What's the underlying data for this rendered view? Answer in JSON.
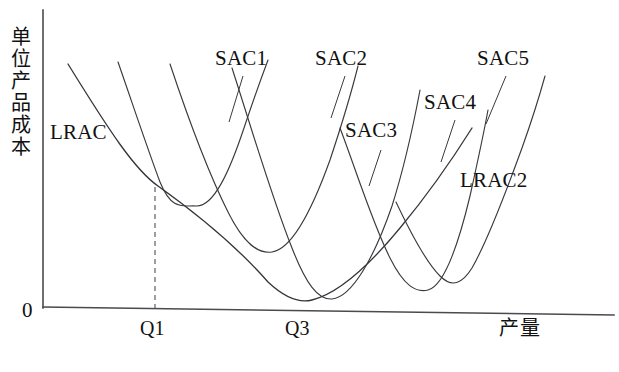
{
  "chart_data": {
    "type": "line",
    "title": "",
    "xlabel": "产量",
    "ylabel": "单位产品成本",
    "grid": false,
    "legend_position": "inline-annotations",
    "xlim": [
      0,
      1
    ],
    "ylim": [
      0,
      1
    ],
    "axis": {
      "origin_label": "0",
      "x_ticks": [
        "Q1",
        "Q3"
      ],
      "x_tick_positions": [
        155,
        300
      ],
      "y_ticks": []
    },
    "annotations": [
      {
        "text": "LRAC",
        "x": 50,
        "y": 122
      },
      {
        "text": "SAC1",
        "x": 215,
        "y": 48
      },
      {
        "text": "SAC2",
        "x": 315,
        "y": 48
      },
      {
        "text": "SAC3",
        "x": 345,
        "y": 120
      },
      {
        "text": "SAC4",
        "x": 424,
        "y": 92
      },
      {
        "text": "SAC5",
        "x": 477,
        "y": 48
      },
      {
        "text": "LRAC2",
        "x": 460,
        "y": 170
      }
    ],
    "series": [
      {
        "name": "LRAC",
        "role": "long-run-envelope",
        "description": "Long-run average cost envelope curve, U-shaped, minimum near Q3",
        "path": "M 68,64 C 110,132 135,170 158,186 C 200,216 240,250 268,282 C 285,298 300,303 312,300 C 340,293 372,262 400,228 C 430,192 455,155 472,128"
      },
      {
        "name": "SAC1",
        "role": "short-run-average-cost",
        "description": "Short-run average cost curve 1, tangent to LRAC at Q1",
        "path": "M 118,62 C 134,108 148,150 160,182 C 172,212 184,205 196,206 C 214,207 230,170 244,128 C 254,98 262,76 268,60"
      },
      {
        "name": "SAC2",
        "role": "short-run-average-cost",
        "description": "Short-run average cost curve 2",
        "path": "M 170,64 C 188,118 208,172 228,212 C 244,244 258,254 272,252 C 292,249 312,210 330,160 C 342,124 352,90 358,66"
      },
      {
        "name": "SAC3",
        "role": "short-run-average-cost",
        "description": "Short-run average cost curve 3, tangent near the LRAC minimum at Q3",
        "path": "M 232,68 C 252,130 272,198 292,248 C 306,284 318,300 332,299 C 352,297 374,258 392,206 C 404,168 414,122 420,90"
      },
      {
        "name": "SAC4",
        "role": "short-run-average-cost",
        "description": "Short-run average cost curve 4",
        "path": "M 340,128 C 356,170 372,222 390,258 C 404,286 416,293 428,290 C 444,286 458,246 470,196 C 478,160 484,132 488,110"
      },
      {
        "name": "SAC5",
        "role": "short-run-average-cost",
        "description": "Short-run average cost curve 5, rightmost rising branch",
        "path": "M 396,202 C 412,236 426,262 440,276 C 452,288 462,284 472,268 C 488,240 506,192 522,148 C 532,120 540,94 545,76"
      }
    ],
    "tangency_marker": {
      "name": "Q1 tangency dashed drop line",
      "x": 155,
      "y_top": 187,
      "y_bottom": 308
    }
  },
  "labels": {
    "lrac": "LRAC",
    "lrac2": "LRAC2",
    "sac1": "SAC1",
    "sac2": "SAC2",
    "sac3": "SAC3",
    "sac4": "SAC4",
    "sac5": "SAC5",
    "origin": "0",
    "q1": "Q1",
    "q3": "Q3",
    "x_axis_title": "产量",
    "y_axis_title_chars": [
      "单",
      "位",
      "产",
      "品",
      "成",
      "本"
    ]
  },
  "colors": {
    "background": "#ffffff",
    "curve_stroke": "#3a3a3e",
    "axis_stroke": "#4a4a50",
    "dash_stroke": "#6a6a70",
    "text": "#111111"
  }
}
